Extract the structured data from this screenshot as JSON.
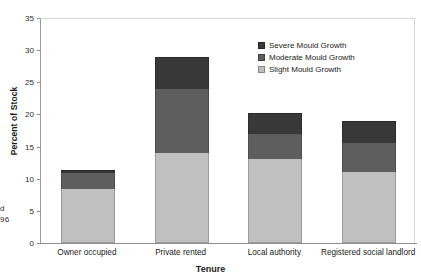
{
  "chart_data": {
    "type": "bar",
    "subtype": "stacked-bar",
    "title": "",
    "xlabel": "Tenure",
    "ylabel": "Percent of Stock",
    "ylim": [
      0,
      35
    ],
    "ytick_step": 5,
    "yticks": [
      "0",
      "5",
      "10",
      "15",
      "20",
      "25",
      "30",
      "35"
    ],
    "grid": false,
    "legend_position": "upper-right-inside",
    "categories": [
      "Owner occupied",
      "Private rented",
      "Local authority",
      "Registered social landlord"
    ],
    "series": [
      {
        "name": "Slight Mould Growth",
        "color": "#c0c0c0",
        "values": [
          8.4,
          14.0,
          13.0,
          11.0
        ]
      },
      {
        "name": "Moderate Mould Growth",
        "color": "#5e5e5e",
        "values": [
          2.5,
          10.0,
          4.0,
          4.5
        ]
      },
      {
        "name": "Severe Mould Growth",
        "color": "#383838",
        "values": [
          0.4,
          5.0,
          3.2,
          3.5
        ]
      }
    ],
    "totals": [
      11.3,
      29.0,
      20.2,
      19.0
    ],
    "legend_entries": [
      "Severe Mould Growth",
      "Moderate Mould Growth",
      "Slight Mould Growth"
    ]
  },
  "margin_text": {
    "line1": "d",
    "line2": "96"
  }
}
